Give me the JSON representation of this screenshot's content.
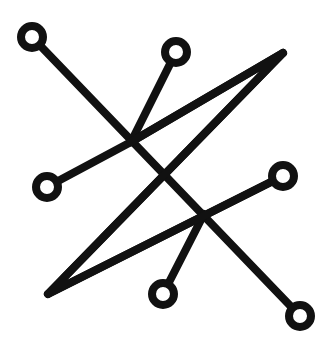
{
  "diagram": {
    "type": "sigil",
    "background": "#ffffff",
    "stroke_color": "#111111",
    "stroke_width": 8,
    "circle_radius": 11,
    "lines": [
      {
        "name": "diagonal-line-main",
        "from": [
          32,
          37
        ],
        "to": [
          300,
          316
        ],
        "terminals": [
          "circle",
          "circle"
        ]
      },
      {
        "name": "triangle-edge-left",
        "from": [
          48,
          294
        ],
        "to": [
          283,
          53
        ],
        "terminals": [
          "none",
          "none"
        ]
      },
      {
        "name": "triangle-edge-bottom",
        "from": [
          48,
          294
        ],
        "to": [
          283,
          176
        ],
        "terminals": [
          "none",
          "circle"
        ]
      },
      {
        "name": "spur-upper-left-to-left-circle",
        "from": [
          131,
          142
        ],
        "to": [
          47,
          187
        ],
        "terminals": [
          "none",
          "circle"
        ]
      },
      {
        "name": "spur-upper-to-top-circle",
        "from": [
          131,
          142
        ],
        "to": [
          176,
          52
        ],
        "terminals": [
          "none",
          "circle"
        ]
      },
      {
        "name": "triangle-edge-top",
        "from": [
          131,
          142
        ],
        "to": [
          283,
          53
        ],
        "terminals": [
          "none",
          "none"
        ]
      },
      {
        "name": "spur-lower-to-bottom-circle",
        "from": [
          204,
          214
        ],
        "to": [
          163,
          294
        ],
        "terminals": [
          "none",
          "circle"
        ]
      }
    ],
    "circles": [
      {
        "name": "circle-top-left",
        "cx": 32,
        "cy": 37
      },
      {
        "name": "circle-top-middle",
        "cx": 176,
        "cy": 52
      },
      {
        "name": "circle-left",
        "cx": 47,
        "cy": 187
      },
      {
        "name": "circle-right",
        "cx": 283,
        "cy": 176
      },
      {
        "name": "circle-bottom",
        "cx": 163,
        "cy": 294
      },
      {
        "name": "circle-bottom-right",
        "cx": 300,
        "cy": 316
      }
    ]
  }
}
